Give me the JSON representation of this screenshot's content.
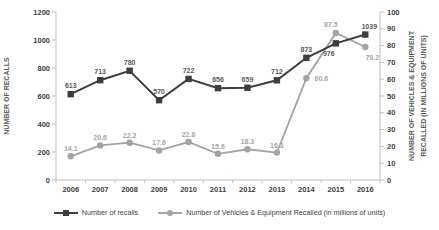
{
  "chart_data": {
    "type": "line",
    "title": "",
    "categories": [
      "2006",
      "2007",
      "2008",
      "2009",
      "2010",
      "2011",
      "2012",
      "2013",
      "2014",
      "2015",
      "2016"
    ],
    "series": [
      {
        "name": "Number of recalls",
        "axis": "left",
        "color": "#3d3d3d",
        "label_color": "#595959",
        "marker": "square",
        "values": [
          613,
          713,
          780,
          570,
          722,
          656,
          659,
          712,
          873,
          976,
          1039
        ]
      },
      {
        "name": "Number of Vehicles & Equipment Recalled (in millions of units)",
        "axis": "right",
        "color": "#a3a3a3",
        "label_color": "#a6a6a6",
        "marker": "circle",
        "values": [
          14.1,
          20.6,
          22.2,
          17.6,
          22.6,
          15.6,
          18.3,
          16.3,
          60.6,
          87.5,
          79.2
        ]
      }
    ],
    "left_axis": {
      "label": "NUMBER OF RECALLS",
      "min": 0,
      "max": 1200,
      "step": 200
    },
    "right_axis": {
      "label_line1": "NUMBER OF VEHICLES & EQUIPMENT",
      "label_line2": "RECALLED (IN MILLIONS OF UNITS)",
      "min": 0,
      "max": 100,
      "step": 10
    },
    "grid": false,
    "legend_position": "bottom",
    "data_labels": true,
    "label_offsets": {
      "0": {
        "9": [
          -7,
          13
        ],
        "10": [
          4,
          -6
        ]
      },
      "1": {
        "8": [
          15,
          3
        ],
        "9": [
          -5,
          -6
        ],
        "10": [
          7,
          13
        ]
      }
    },
    "axis_color": "#bfbfbf",
    "tick_label_color": "#404040",
    "axis_title_color": "#595959"
  }
}
